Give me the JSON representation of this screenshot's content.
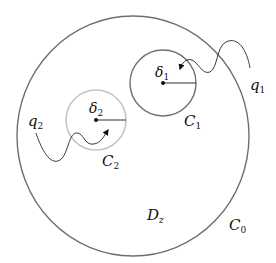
{
  "diagram": {
    "colors": {
      "outer_circle": "#6e6e6e",
      "inner_circle_1": "#707070",
      "inner_circle_2": "#c4c4c4",
      "path": "#222222",
      "background": "#ffffff"
    },
    "labels": {
      "C0": {
        "base": "C",
        "sub": "0"
      },
      "C1": {
        "base": "C",
        "sub": "1"
      },
      "C2": {
        "base": "C",
        "sub": "2"
      },
      "delta1": {
        "base": "δ",
        "sub": "1"
      },
      "delta2": {
        "base": "δ",
        "sub": "2"
      },
      "q1": {
        "base": "q",
        "sub": "1"
      },
      "q2": {
        "base": "q",
        "sub": "2"
      },
      "Dz": {
        "base": "D",
        "sub": "z"
      }
    },
    "nodes": [
      {
        "id": "C0",
        "type": "circle",
        "label": "C_0",
        "region": "D_z"
      },
      {
        "id": "C1",
        "type": "circle",
        "label": "C_1",
        "center": "δ_1"
      },
      {
        "id": "C2",
        "type": "circle",
        "label": "C_2",
        "center": "δ_2"
      }
    ],
    "edges": [
      {
        "from": "q1",
        "to": "δ_1",
        "style": "wavy-arrow"
      },
      {
        "from": "q2",
        "to": "δ_2",
        "style": "wavy-arrow"
      }
    ]
  }
}
